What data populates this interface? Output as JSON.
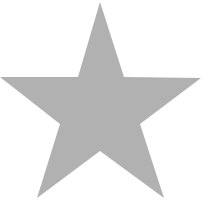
{
  "figure": {
    "shape": "five-pointed-star",
    "icon": "star-icon",
    "fill_color": "#b1b1b1",
    "background_color": "#ffffff",
    "points": "100,2 124,77 201,78 140,124 164,198 100,151 37,198 60,124 0,77 78,77"
  }
}
